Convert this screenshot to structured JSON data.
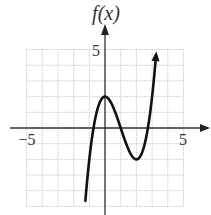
{
  "chart_data": {
    "type": "line",
    "title": "",
    "function_label": "f(x)",
    "xlabel": "",
    "ylabel": "f(x)",
    "xlim": [
      -5,
      5
    ],
    "ylim": [
      -5,
      5
    ],
    "grid": true,
    "grid_step": 1,
    "tick_labels": {
      "x": [
        {
          "value": -5,
          "label": "−5"
        },
        {
          "value": 5,
          "label": "5"
        }
      ],
      "y": [
        {
          "value": 5,
          "label": "5"
        }
      ]
    },
    "series": [
      {
        "name": "f(x)",
        "description": "cubic with local max at (0,2) and local min at (2,-2); approx f(x)=x^3-3x^2+2",
        "points": [
          [
            -1.2,
            -4.05
          ],
          [
            -1.0,
            -2.0
          ],
          [
            -0.73,
            0.0
          ],
          [
            -0.5,
            1.125
          ],
          [
            0.0,
            2.0
          ],
          [
            0.5,
            1.375
          ],
          [
            1.0,
            0.0
          ],
          [
            1.5,
            -1.375
          ],
          [
            2.0,
            -2.0
          ],
          [
            2.5,
            -1.125
          ],
          [
            2.73,
            0.0
          ],
          [
            3.0,
            2.0
          ],
          [
            3.25,
            4.64
          ]
        ],
        "key_points": {
          "local_max": [
            0,
            2
          ],
          "local_min": [
            2,
            -2
          ],
          "roots": [
            -0.73,
            1.0,
            2.73
          ]
        },
        "arrow_end": "top-right"
      }
    ],
    "colors": {
      "curve": "#111111",
      "axis": "#333333",
      "grid": "#c8c8c8"
    }
  }
}
